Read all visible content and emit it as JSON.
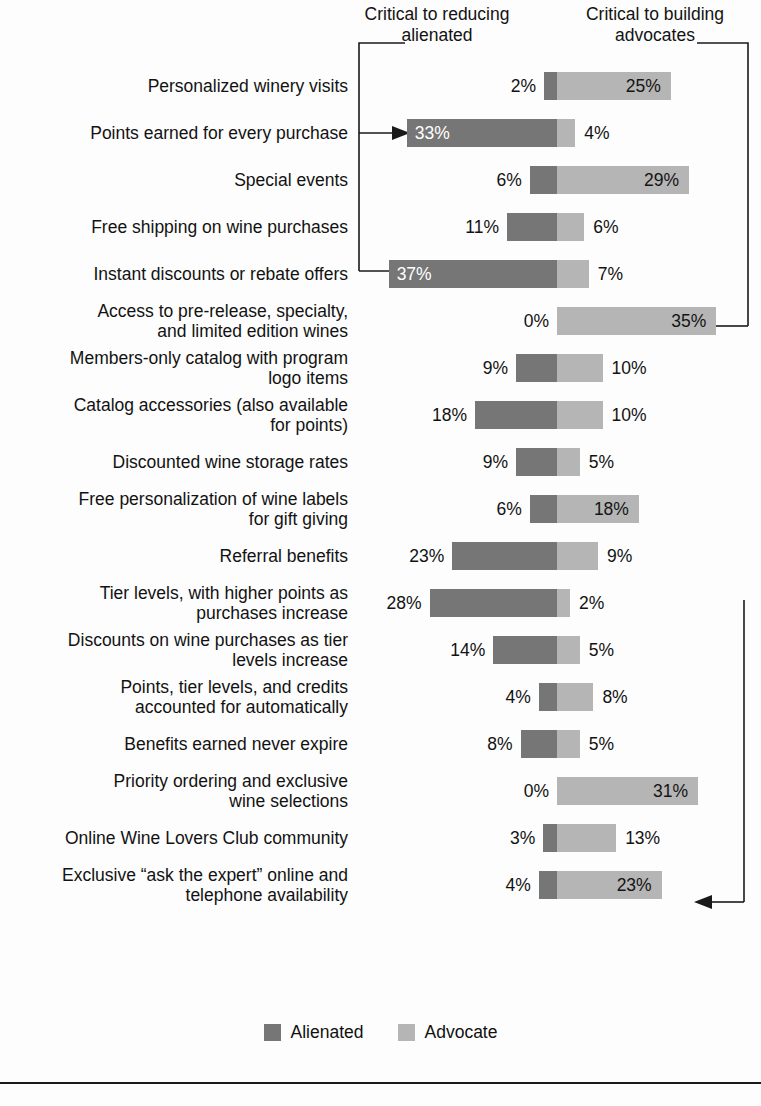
{
  "header": {
    "left_caption": "Critical to reducing\nalienated",
    "right_caption": "Critical to building\nadvocates"
  },
  "legend": {
    "alienated_label": "Alienated",
    "advocate_label": "Advocate",
    "alienated_color": "#767676",
    "advocate_color": "#b5b5b5"
  },
  "chart_data": {
    "type": "bar",
    "subtype": "diverging-stacked-bar",
    "title": "",
    "xlabel": "",
    "ylabel": "",
    "grid": false,
    "legend_position": "bottom-center",
    "axis_center_value": 0,
    "value_suffix": "%",
    "series": [
      {
        "name": "Alienated",
        "color": "#767676",
        "direction": "left",
        "values": [
          2,
          33,
          6,
          11,
          37,
          0,
          9,
          18,
          9,
          6,
          23,
          28,
          14,
          4,
          8,
          0,
          3,
          4
        ]
      },
      {
        "name": "Advocate",
        "color": "#b5b5b5",
        "direction": "right",
        "values": [
          25,
          4,
          29,
          6,
          7,
          35,
          10,
          10,
          5,
          18,
          9,
          2,
          5,
          8,
          5,
          31,
          13,
          23
        ]
      }
    ],
    "categories": [
      "Personalized winery visits",
      "Points earned for every purchase",
      "Special events",
      "Free shipping on wine purchases",
      "Instant discounts or rebate offers",
      "Access to pre-release, specialty,\nand limited edition wines",
      "Members-only catalog with program\nlogo items",
      "Catalog accessories (also available\nfor points)",
      "Discounted wine storage rates",
      "Free personalization of wine labels\nfor gift giving",
      "Referral benefits",
      "Tier levels, with higher points as\npurchases increase",
      "Discounts on wine purchases as tier\nlevels increase",
      "Points, tier levels, and credits\naccounted for automatically",
      "Benefits earned never expire",
      "Priority ordering and exclusive\nwine selections",
      "Online Wine Lovers Club community",
      "Exclusive “ask the expert” online and\ntelephone availability"
    ],
    "annotations": [
      {
        "name": "left-bracket",
        "side": "left",
        "caption": "Critical to reducing alienated",
        "target_rows": [
          1,
          4
        ],
        "target_values": [
          "33%",
          "37%"
        ]
      },
      {
        "name": "right-bracket",
        "side": "right",
        "caption": "Critical to building advocates",
        "target_rows": [
          5,
          15
        ],
        "target_values": [
          "35%",
          "31%"
        ]
      }
    ]
  },
  "rows": [
    {
      "label": "Personalized winery visits",
      "alienated": "2%",
      "advocate": "25%",
      "alienated_v": 2,
      "advocate_v": 25
    },
    {
      "label": "Points earned for every purchase",
      "alienated": "33%",
      "advocate": "4%",
      "alienated_v": 33,
      "advocate_v": 4
    },
    {
      "label": "Special events",
      "alienated": "6%",
      "advocate": "29%",
      "alienated_v": 6,
      "advocate_v": 29
    },
    {
      "label": "Free shipping on wine purchases",
      "alienated": "11%",
      "advocate": "6%",
      "alienated_v": 11,
      "advocate_v": 6
    },
    {
      "label": "Instant discounts or rebate offers",
      "alienated": "37%",
      "advocate": "7%",
      "alienated_v": 37,
      "advocate_v": 7
    },
    {
      "label": "Access to pre-release, specialty,\nand limited edition wines",
      "alienated": "0%",
      "advocate": "35%",
      "alienated_v": 0,
      "advocate_v": 35
    },
    {
      "label": "Members-only catalog with program\nlogo items",
      "alienated": "9%",
      "advocate": "10%",
      "alienated_v": 9,
      "advocate_v": 10
    },
    {
      "label": "Catalog accessories (also available\nfor points)",
      "alienated": "18%",
      "advocate": "10%",
      "alienated_v": 18,
      "advocate_v": 10
    },
    {
      "label": "Discounted wine storage rates",
      "alienated": "9%",
      "advocate": "5%",
      "alienated_v": 9,
      "advocate_v": 5
    },
    {
      "label": "Free personalization of wine labels\nfor gift giving",
      "alienated": "6%",
      "advocate": "18%",
      "alienated_v": 6,
      "advocate_v": 18
    },
    {
      "label": "Referral benefits",
      "alienated": "23%",
      "advocate": "9%",
      "alienated_v": 23,
      "advocate_v": 9
    },
    {
      "label": "Tier levels, with higher points as\npurchases increase",
      "alienated": "28%",
      "advocate": "2%",
      "alienated_v": 28,
      "advocate_v": 2
    },
    {
      "label": "Discounts on wine purchases as tier\nlevels increase",
      "alienated": "14%",
      "advocate": "5%",
      "alienated_v": 14,
      "advocate_v": 5
    },
    {
      "label": "Points, tier levels, and credits\naccounted for automatically",
      "alienated": "4%",
      "advocate": "8%",
      "alienated_v": 4,
      "advocate_v": 8
    },
    {
      "label": "Benefits earned never expire",
      "alienated": "8%",
      "advocate": "5%",
      "alienated_v": 8,
      "advocate_v": 5
    },
    {
      "label": "Priority ordering and exclusive\nwine selections",
      "alienated": "0%",
      "advocate": "31%",
      "alienated_v": 0,
      "advocate_v": 31
    },
    {
      "label": "Online Wine Lovers Club community",
      "alienated": "3%",
      "advocate": "13%",
      "alienated_v": 3,
      "advocate_v": 13
    },
    {
      "label": "Exclusive “ask the expert” online and\ntelephone availability",
      "alienated": "4%",
      "advocate": "23%",
      "alienated_v": 4,
      "advocate_v": 23
    }
  ]
}
